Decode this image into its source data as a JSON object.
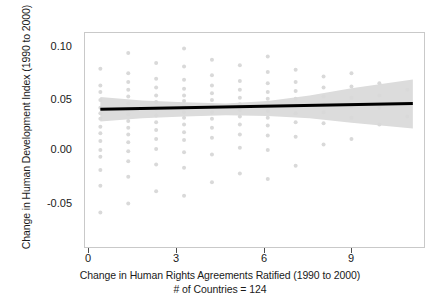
{
  "chart_data": {
    "type": "scatter",
    "title": "",
    "xlabel": "Change in Human Rights Agreements Ratified (1990 to 2000)",
    "xsublabel": "# of Countries = 124",
    "ylabel": "Change in Human Development Index (1990 to 2000)",
    "xlim": [
      -0.55,
      11.6
    ],
    "ylim": [
      -0.077,
      0.115
    ],
    "xticks": [
      0,
      3,
      6,
      9
    ],
    "xticklabels": [
      "0",
      "3",
      "6",
      "9"
    ],
    "yticks": [
      0.1,
      0.05,
      0.0,
      -0.05
    ],
    "yticklabels": [
      "0.10",
      "0.05",
      "0.00",
      "-0.05"
    ],
    "grid": false,
    "legend": null,
    "n_countries": 124,
    "series": [
      {
        "name": "Country observations",
        "type": "scatter",
        "marker_color": "#d9d9d9",
        "marker_size": 2.0,
        "x": [
          0,
          0,
          0,
          0,
          0,
          0,
          0,
          0,
          0,
          0,
          0,
          0,
          0,
          0,
          0,
          1,
          1,
          1,
          1,
          1,
          1,
          1,
          1,
          1,
          1,
          1,
          1,
          1,
          1,
          1,
          1,
          2,
          2,
          2,
          2,
          2,
          2,
          2,
          2,
          2,
          2,
          2,
          2,
          2,
          3,
          3,
          3,
          3,
          3,
          3,
          3,
          3,
          3,
          3,
          3,
          3,
          3,
          3,
          3,
          4,
          4,
          4,
          4,
          4,
          4,
          4,
          4,
          4,
          4,
          4,
          4,
          5,
          5,
          5,
          5,
          5,
          5,
          5,
          5,
          5,
          5,
          5,
          6,
          6,
          6,
          6,
          6,
          6,
          6,
          6,
          6,
          6,
          6,
          6,
          7,
          7,
          7,
          7,
          7,
          7,
          7,
          7,
          7,
          8,
          8,
          8,
          8,
          8,
          8,
          8,
          9,
          9,
          9,
          9,
          9,
          9,
          10,
          10,
          10,
          10,
          11,
          11,
          11
        ],
        "y": [
          0.083,
          0.068,
          0.062,
          0.055,
          0.048,
          0.043,
          0.038,
          0.031,
          0.025,
          0.018,
          0.01,
          0.004,
          -0.008,
          -0.022,
          -0.046,
          0.097,
          0.079,
          0.071,
          0.064,
          0.058,
          0.052,
          0.047,
          0.042,
          0.036,
          0.03,
          0.024,
          0.017,
          0.009,
          0.0,
          -0.014,
          -0.038,
          0.088,
          0.074,
          0.066,
          0.059,
          0.053,
          0.047,
          0.041,
          0.035,
          0.028,
          0.02,
          0.011,
          -0.003,
          -0.027,
          0.101,
          0.085,
          0.073,
          0.065,
          0.059,
          0.054,
          0.049,
          0.044,
          0.039,
          0.033,
          0.026,
          0.019,
          0.008,
          -0.006,
          -0.031,
          0.091,
          0.077,
          0.068,
          0.061,
          0.055,
          0.05,
          0.044,
          0.038,
          0.03,
          0.021,
          0.006,
          -0.019,
          0.086,
          0.072,
          0.064,
          0.057,
          0.051,
          0.046,
          0.04,
          0.033,
          0.024,
          0.012,
          -0.011,
          0.094,
          0.08,
          0.07,
          0.062,
          0.056,
          0.05,
          0.045,
          0.039,
          0.032,
          0.023,
          0.01,
          -0.016,
          0.082,
          0.071,
          0.063,
          0.056,
          0.05,
          0.043,
          0.035,
          0.022,
          -0.004,
          0.076,
          0.066,
          0.058,
          0.051,
          0.044,
          0.034,
          0.015,
          0.079,
          0.067,
          0.057,
          0.049,
          0.039,
          0.02,
          0.07,
          0.059,
          0.048,
          0.033,
          0.064,
          0.052,
          0.04
        ]
      },
      {
        "name": "Linear fit",
        "type": "line",
        "color": "#000000",
        "line_width": 3.0,
        "x": [
          0,
          11.2
        ],
        "y": [
          0.0465,
          0.0518
        ],
        "intercept": 0.0465,
        "slope": 0.00047
      },
      {
        "name": "95% confidence band",
        "type": "band",
        "color": "#dcdcdc",
        "x": [
          0,
          1.5,
          3,
          4.5,
          6,
          7.5,
          9,
          11.2
        ],
        "y_low": [
          0.0355,
          0.0385,
          0.04,
          0.0412,
          0.0405,
          0.0385,
          0.0345,
          0.0293
        ],
        "y_high": [
          0.0575,
          0.0545,
          0.0528,
          0.0518,
          0.054,
          0.059,
          0.0655,
          0.0732
        ]
      }
    ]
  },
  "axes": {
    "frame_color": "#c9c9c9",
    "tick_color": "#4d4d4d"
  }
}
